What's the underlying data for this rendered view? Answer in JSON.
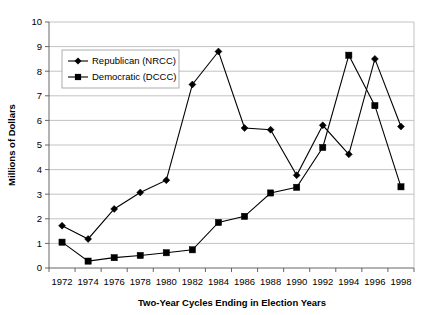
{
  "chart_data": {
    "type": "line",
    "title": "",
    "xlabel": "Two-Year Cycles Ending in Election Years",
    "ylabel": "Millions of Dollars",
    "xlim": [
      1971,
      1999
    ],
    "ylim": [
      0,
      10
    ],
    "ytick_step": 1,
    "grid": true,
    "legend_position": "upper-left-inside",
    "categories": [
      1972,
      1974,
      1976,
      1978,
      1980,
      1982,
      1984,
      1986,
      1988,
      1990,
      1992,
      1994,
      1996,
      1998
    ],
    "xtick_labels": [
      "1972",
      "1974",
      "1976",
      "1978",
      "1980",
      "1982",
      "1984",
      "1986",
      "1988",
      "1990",
      "1992",
      "1994",
      "1996",
      "1998"
    ],
    "ytick_labels": [
      "0",
      "1",
      "2",
      "3",
      "4",
      "5",
      "6",
      "7",
      "8",
      "9",
      "10"
    ],
    "series": [
      {
        "name": "Republican (NRCC)",
        "marker": "diamond",
        "color": "#000000",
        "values": [
          1.72,
          1.18,
          2.4,
          3.07,
          3.57,
          7.46,
          8.8,
          5.69,
          5.62,
          3.77,
          5.8,
          4.62,
          8.5,
          5.75
        ]
      },
      {
        "name": "Democratic (DCCC)",
        "marker": "square",
        "color": "#000000",
        "values": [
          1.05,
          0.28,
          0.42,
          0.51,
          0.62,
          0.74,
          1.85,
          2.1,
          3.05,
          3.28,
          4.9,
          8.65,
          6.6,
          3.3
        ]
      }
    ]
  },
  "legend": {
    "items": [
      {
        "label": "Republican (NRCC)"
      },
      {
        "label": "Democratic (DCCC)"
      }
    ]
  },
  "axes": {
    "x_title": "Two-Year Cycles Ending in Election Years",
    "y_title": "Millions of Dollars"
  }
}
